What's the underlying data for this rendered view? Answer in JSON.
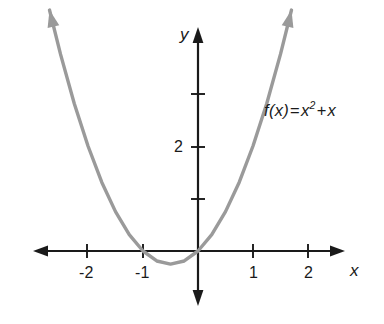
{
  "figure": {
    "background_color": "#ffffff",
    "curve_color": "#9a9a9a",
    "axis_color": "#1a1a1a"
  },
  "axes": {
    "x_axis_name": "x",
    "y_axis_name": "y"
  },
  "function_label": {
    "full": "f(x) = x2 + x",
    "fx": "f(x)",
    "equals": "=",
    "base": "x",
    "exponent": "2",
    "plus": "+",
    "linear_term": "x"
  },
  "chart_data": {
    "type": "line",
    "title": "",
    "subtitle": "",
    "xlabel": "x",
    "ylabel": "y",
    "xlim": [
      -2.95,
      2.65
    ],
    "ylim": [
      -1.1,
      4.25
    ],
    "grid": false,
    "legend_position": "none",
    "annotations": [
      {
        "text": "f(x) = x2 + x",
        "x": 1.2,
        "y": 2.9
      }
    ],
    "xticks": [
      -2,
      -1,
      1,
      2
    ],
    "xticklabels": [
      "-2",
      "-1",
      "1",
      "2"
    ],
    "yticks": [
      1,
      2,
      3,
      4
    ],
    "yticklabels": [
      "",
      "2",
      "",
      ""
    ],
    "series": [
      {
        "name": "f(x) = x2 + x",
        "expression": "x^2 + x",
        "color": "#9a9a9a",
        "vertex": [
          -0.5,
          -0.25
        ],
        "roots": [
          -1,
          0
        ],
        "x": [
          -2.7,
          -2.5,
          -2.25,
          -2.0,
          -1.75,
          -1.5,
          -1.25,
          -1.0,
          -0.75,
          -0.5,
          -0.25,
          0.0,
          0.25,
          0.5,
          0.75,
          1.0,
          1.25,
          1.5,
          1.7
        ],
        "values": [
          4.59,
          3.75,
          2.81,
          2.0,
          1.31,
          0.75,
          0.31,
          0.0,
          -0.19,
          -0.25,
          -0.19,
          0.0,
          0.31,
          0.75,
          1.31,
          2.0,
          2.81,
          3.75,
          4.59
        ]
      }
    ]
  },
  "tick_labels": {
    "x_neg2": "-2",
    "x_neg1": "-1",
    "x_pos1": "1",
    "x_pos2": "2",
    "y_pos2": "2"
  }
}
